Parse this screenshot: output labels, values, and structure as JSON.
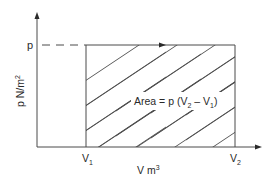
{
  "diagram": {
    "type": "pressure-volume (p-V) diagram, constant pressure process",
    "y_axis": {
      "label": "p N/m",
      "label_superscript": "2",
      "level_label": "p"
    },
    "x_axis": {
      "label": "V m",
      "label_superscript": "3",
      "tick_labels": [
        {
          "main": "V",
          "sub": "1"
        },
        {
          "main": "V",
          "sub": "2"
        }
      ]
    },
    "area_label": {
      "prefix": "Area = p (V",
      "sub1": "2",
      "mid": " – V",
      "sub2": "1",
      "suffix": ")"
    },
    "colors": {
      "line": "#4a4a4a",
      "text": "#2a2a2a",
      "background": "#ffffff"
    }
  }
}
